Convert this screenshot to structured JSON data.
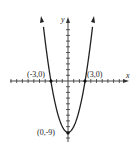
{
  "chart_data": {
    "type": "line",
    "title": "",
    "function": "y = x^2 - 9",
    "xlabel": "x",
    "ylabel": "y",
    "xlim": [
      -10,
      10
    ],
    "ylim": [
      -10,
      11
    ],
    "grid": false,
    "series": [
      {
        "name": "parabola",
        "x": [
          -4.3,
          -4,
          -3,
          -2,
          -1,
          0,
          1,
          2,
          3,
          4,
          4.3
        ],
        "values": [
          9.49,
          7,
          0,
          -5,
          -8,
          -9,
          -8,
          -5,
          0,
          7,
          9.49
        ]
      }
    ],
    "annotations": [
      {
        "text": "(-3,0)",
        "x": -3,
        "y": 0
      },
      {
        "text": "(3,0)",
        "x": 3,
        "y": 0
      },
      {
        "text": "(0,-9)",
        "x": 0,
        "y": -9
      }
    ]
  },
  "labels": {
    "x_axis": "x",
    "y_axis": "y",
    "left_root": "(-3,0)",
    "right_root": "(3,0)",
    "vertex": "(0,-9)"
  },
  "colors": {
    "curve": "#222222",
    "axis": "#333333"
  }
}
